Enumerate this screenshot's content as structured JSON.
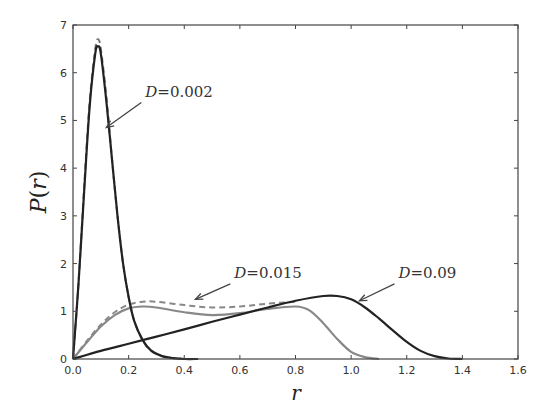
{
  "chart_data": {
    "type": "line",
    "title": "",
    "xlabel": "r",
    "ylabel": "P(r)",
    "xlim": [
      0.0,
      1.6
    ],
    "ylim": [
      0,
      7
    ],
    "grid": false,
    "legend": null,
    "x_ticks": [
      "0.0",
      "0.2",
      "0.4",
      "0.6",
      "0.8",
      "1.0",
      "1.2",
      "1.4",
      "1.6"
    ],
    "y_ticks": [
      "0",
      "1",
      "2",
      "3",
      "4",
      "5",
      "6",
      "7"
    ],
    "series": [
      {
        "name": "D=0.002 (solid)",
        "style": "solid",
        "color": "#222222",
        "x": [
          0.0,
          0.02,
          0.04,
          0.06,
          0.08,
          0.09,
          0.1,
          0.12,
          0.14,
          0.16,
          0.18,
          0.2,
          0.22,
          0.25,
          0.28,
          0.32,
          0.36,
          0.4,
          0.45
        ],
        "y": [
          0.0,
          1.6,
          3.5,
          5.3,
          6.4,
          6.55,
          6.4,
          5.4,
          4.2,
          3.0,
          2.0,
          1.3,
          0.8,
          0.4,
          0.18,
          0.06,
          0.02,
          0.0,
          0.0
        ]
      },
      {
        "name": "D=0.002 (dashed)",
        "style": "dashed",
        "color": "#777777",
        "x": [
          0.0,
          0.02,
          0.04,
          0.06,
          0.08,
          0.09,
          0.1,
          0.12,
          0.14,
          0.16,
          0.18,
          0.2,
          0.22,
          0.25,
          0.28,
          0.32,
          0.36,
          0.4
        ],
        "y": [
          0.0,
          1.6,
          3.6,
          5.4,
          6.5,
          6.7,
          6.5,
          5.5,
          4.2,
          3.0,
          2.0,
          1.3,
          0.8,
          0.4,
          0.18,
          0.06,
          0.02,
          0.0
        ]
      },
      {
        "name": "D=0.015 (solid)",
        "style": "solid",
        "color": "#888888",
        "x": [
          0.0,
          0.05,
          0.1,
          0.15,
          0.2,
          0.25,
          0.3,
          0.4,
          0.5,
          0.6,
          0.7,
          0.8,
          0.85,
          0.9,
          0.95,
          1.0,
          1.05,
          1.1
        ],
        "y": [
          0.0,
          0.35,
          0.68,
          0.92,
          1.06,
          1.1,
          1.08,
          0.98,
          0.92,
          0.96,
          1.05,
          1.1,
          1.02,
          0.75,
          0.42,
          0.15,
          0.04,
          0.0
        ]
      },
      {
        "name": "D=0.015 (dashed)",
        "style": "dashed",
        "color": "#888888",
        "x": [
          0.0,
          0.05,
          0.1,
          0.15,
          0.2,
          0.25,
          0.3,
          0.4,
          0.5,
          0.6,
          0.7,
          0.8
        ],
        "y": [
          0.0,
          0.38,
          0.72,
          0.98,
          1.14,
          1.2,
          1.2,
          1.13,
          1.08,
          1.1,
          1.16,
          1.2
        ]
      },
      {
        "name": "D=0.09 (solid)",
        "style": "solid",
        "color": "#222222",
        "x": [
          0.0,
          0.1,
          0.2,
          0.3,
          0.4,
          0.5,
          0.6,
          0.7,
          0.8,
          0.9,
          0.95,
          1.0,
          1.05,
          1.1,
          1.15,
          1.2,
          1.25,
          1.3,
          1.35,
          1.4
        ],
        "y": [
          0.0,
          0.17,
          0.32,
          0.47,
          0.62,
          0.78,
          0.93,
          1.08,
          1.22,
          1.32,
          1.32,
          1.25,
          1.08,
          0.85,
          0.6,
          0.36,
          0.17,
          0.06,
          0.01,
          0.0
        ]
      }
    ],
    "annotations": [
      {
        "text": "D = 0.002",
        "xy": [
          0.12,
          4.85
        ],
        "xytext": [
          0.26,
          5.5
        ]
      },
      {
        "text": "D = 0.015",
        "xy": [
          0.44,
          1.25
        ],
        "xytext": [
          0.58,
          1.7
        ]
      },
      {
        "text": "D = 0.09",
        "xy": [
          1.03,
          1.22
        ],
        "xytext": [
          1.17,
          1.7
        ]
      }
    ]
  },
  "labels": {
    "xlabel": "r",
    "ylabel_p": "P",
    "ylabel_open": "(",
    "ylabel_r": "r",
    "ylabel_close": ")",
    "ann1": "D = 0.002",
    "ann2": "D = 0.015",
    "ann3": "D = 0.09"
  }
}
